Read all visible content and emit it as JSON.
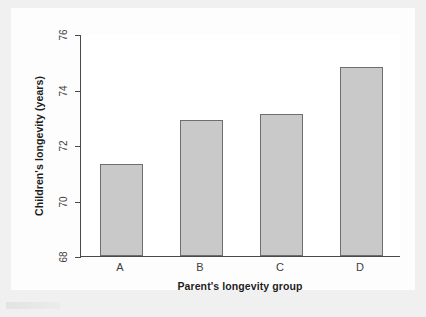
{
  "chart_data": {
    "type": "bar",
    "title": "",
    "subtitle": "",
    "xlabel": "Parent's longevity group",
    "ylabel": "Children's longevity (years)",
    "categories": [
      "A",
      "B",
      "C",
      "D"
    ],
    "values": [
      71.3,
      72.9,
      73.1,
      74.8
    ],
    "series": [
      {
        "name": "Children's longevity",
        "values": [
          71.3,
          72.9,
          73.1,
          74.8
        ]
      }
    ],
    "ylim": [
      68,
      76
    ],
    "yticks": [
      68,
      70,
      72,
      74,
      76
    ],
    "ytick_labels": [
      "68",
      "70",
      "72",
      "74",
      "76"
    ],
    "grid": false,
    "legend": false,
    "legend_position": "none",
    "bar_fill_color": "#c9c9c9",
    "bar_edge_color": "#6e6e6e",
    "axis_color": "#4a4a4a",
    "panel_background": "#ffffff",
    "figure_background": "#f0f0f0"
  }
}
